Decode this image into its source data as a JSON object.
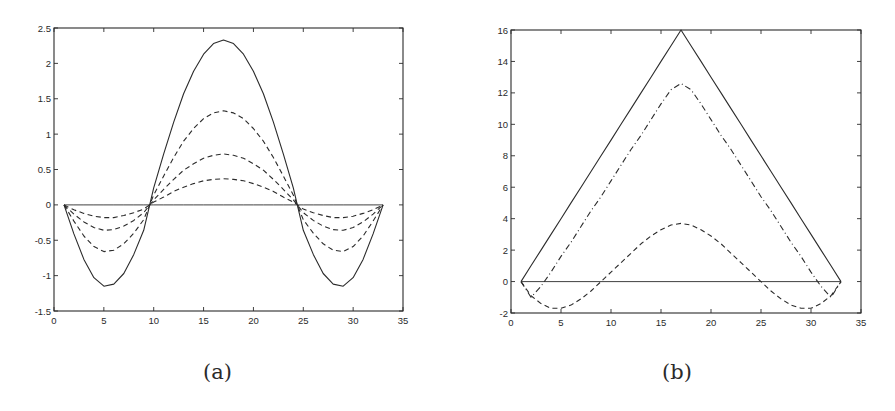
{
  "chart_data": [
    {
      "id": "a",
      "type": "line",
      "caption": "(a)",
      "title": "",
      "xlabel": "",
      "ylabel": "",
      "xlim": [
        0,
        35
      ],
      "ylim": [
        -1.5,
        2.5
      ],
      "xticks": [
        0,
        5,
        10,
        15,
        20,
        25,
        30,
        35
      ],
      "yticks": [
        -1.5,
        -1,
        -0.5,
        0,
        0.5,
        1,
        1.5,
        2,
        2.5
      ],
      "xtick_labels": [
        "0",
        "5",
        "10",
        "15",
        "20",
        "25",
        "30",
        "35"
      ],
      "ytick_labels": [
        "-1.5",
        "-1",
        "-0.5",
        "0",
        "0.5",
        "1",
        "1.5",
        "2",
        "2.5"
      ],
      "grid": false,
      "legend": null,
      "box": {
        "left": 54,
        "top": 28,
        "right": 403,
        "bottom": 311
      },
      "x": [
        1,
        2,
        3,
        4,
        5,
        6,
        7,
        8,
        9,
        10,
        11,
        12,
        13,
        14,
        15,
        16,
        17,
        18,
        19,
        20,
        21,
        22,
        23,
        24,
        25,
        26,
        27,
        28,
        29,
        30,
        31,
        32,
        33
      ],
      "series": [
        {
          "name": "zero-line",
          "style": "solid",
          "values": [
            0,
            0,
            0,
            0,
            0,
            0,
            0,
            0,
            0,
            0,
            0,
            0,
            0,
            0,
            0,
            0,
            0,
            0,
            0,
            0,
            0,
            0,
            0,
            0,
            0,
            0,
            0,
            0,
            0,
            0,
            0,
            0,
            0
          ]
        },
        {
          "name": "solid-curve",
          "style": "solid",
          "values": [
            0,
            -0.41,
            -0.77,
            -1.03,
            -1.15,
            -1.12,
            -0.97,
            -0.7,
            -0.36,
            0.24,
            0.72,
            1.17,
            1.57,
            1.89,
            2.13,
            2.28,
            2.33,
            2.28,
            2.13,
            1.89,
            1.57,
            1.17,
            0.72,
            0.24,
            -0.36,
            -0.7,
            -0.97,
            -1.12,
            -1.15,
            -1.03,
            -0.77,
            -0.41,
            0
          ]
        },
        {
          "name": "dashed-curve-1",
          "style": "dashed",
          "values": [
            0,
            -0.23,
            -0.44,
            -0.59,
            -0.66,
            -0.64,
            -0.55,
            -0.4,
            -0.21,
            0.14,
            0.41,
            0.67,
            0.9,
            1.08,
            1.22,
            1.3,
            1.33,
            1.3,
            1.22,
            1.08,
            0.9,
            0.67,
            0.41,
            0.14,
            -0.21,
            -0.4,
            -0.55,
            -0.64,
            -0.66,
            -0.59,
            -0.44,
            -0.23,
            0
          ]
        },
        {
          "name": "dashed-curve-2",
          "style": "dashed",
          "values": [
            0,
            -0.13,
            -0.24,
            -0.32,
            -0.36,
            -0.35,
            -0.3,
            -0.22,
            -0.11,
            0.07,
            0.22,
            0.36,
            0.49,
            0.58,
            0.66,
            0.7,
            0.72,
            0.7,
            0.66,
            0.58,
            0.49,
            0.36,
            0.22,
            0.07,
            -0.11,
            -0.22,
            -0.3,
            -0.35,
            -0.36,
            -0.32,
            -0.24,
            -0.13,
            0
          ]
        },
        {
          "name": "dashed-curve-3",
          "style": "dashed",
          "values": [
            0,
            -0.07,
            -0.12,
            -0.16,
            -0.18,
            -0.18,
            -0.15,
            -0.11,
            -0.06,
            0.04,
            0.11,
            0.19,
            0.25,
            0.3,
            0.34,
            0.36,
            0.37,
            0.36,
            0.34,
            0.3,
            0.25,
            0.19,
            0.11,
            0.04,
            -0.06,
            -0.11,
            -0.15,
            -0.18,
            -0.18,
            -0.16,
            -0.12,
            -0.07,
            0
          ]
        }
      ]
    },
    {
      "id": "b",
      "type": "line",
      "caption": "(b)",
      "title": "",
      "xlabel": "",
      "ylabel": "",
      "xlim": [
        0,
        35
      ],
      "ylim": [
        -2,
        16
      ],
      "xticks": [
        0,
        5,
        10,
        15,
        20,
        25,
        30,
        35
      ],
      "yticks": [
        -2,
        0,
        2,
        4,
        6,
        8,
        10,
        12,
        14,
        16
      ],
      "xtick_labels": [
        "0",
        "5",
        "10",
        "15",
        "20",
        "25",
        "30",
        "35"
      ],
      "ytick_labels": [
        "-2",
        "0",
        "2",
        "4",
        "6",
        "8",
        "10",
        "12",
        "14",
        "16"
      ],
      "grid": false,
      "legend": null,
      "box": {
        "left": 511,
        "top": 30,
        "right": 861,
        "bottom": 313
      },
      "x": [
        1,
        2,
        3,
        4,
        5,
        6,
        7,
        8,
        9,
        10,
        11,
        12,
        13,
        14,
        15,
        16,
        17,
        18,
        19,
        20,
        21,
        22,
        23,
        24,
        25,
        26,
        27,
        28,
        29,
        30,
        31,
        32,
        33
      ],
      "series": [
        {
          "name": "zero-line",
          "style": "solid",
          "values": [
            0,
            0,
            0,
            0,
            0,
            0,
            0,
            0,
            0,
            0,
            0,
            0,
            0,
            0,
            0,
            0,
            0,
            0,
            0,
            0,
            0,
            0,
            0,
            0,
            0,
            0,
            0,
            0,
            0,
            0,
            0,
            0,
            0
          ]
        },
        {
          "name": "solid-triangle",
          "style": "solid",
          "values": [
            0,
            1,
            2,
            3,
            4,
            5,
            6,
            7,
            8,
            9,
            10,
            11,
            12,
            13,
            14,
            15,
            16,
            15,
            14,
            13,
            12,
            11,
            10,
            9,
            8,
            7,
            6,
            5,
            4,
            3,
            2,
            1,
            0
          ]
        },
        {
          "name": "dashdot-curve",
          "style": "dashdot",
          "values": [
            0,
            -1.0,
            -0.3,
            0.6,
            1.6,
            2.5,
            3.5,
            4.5,
            5.4,
            6.4,
            7.4,
            8.4,
            9.3,
            10.3,
            11.3,
            12.2,
            12.6,
            12.2,
            11.3,
            10.3,
            9.3,
            8.4,
            7.4,
            6.4,
            5.4,
            4.5,
            3.5,
            2.5,
            1.6,
            0.6,
            -0.3,
            -1.0,
            0
          ]
        },
        {
          "name": "dashed-curve",
          "style": "dashed",
          "values": [
            0,
            -0.9,
            -1.4,
            -1.7,
            -1.7,
            -1.5,
            -1.1,
            -0.6,
            0.0,
            0.6,
            1.2,
            1.8,
            2.4,
            2.9,
            3.3,
            3.6,
            3.7,
            3.6,
            3.3,
            2.9,
            2.4,
            1.8,
            1.2,
            0.6,
            0.0,
            -0.6,
            -1.1,
            -1.5,
            -1.7,
            -1.7,
            -1.4,
            -0.9,
            0
          ]
        }
      ]
    }
  ],
  "captions": {
    "a": "(a)",
    "b": "(b)"
  },
  "colors": {
    "line": "#2b2b2b",
    "axis": "#2b2b2b",
    "background": "#ffffff"
  }
}
